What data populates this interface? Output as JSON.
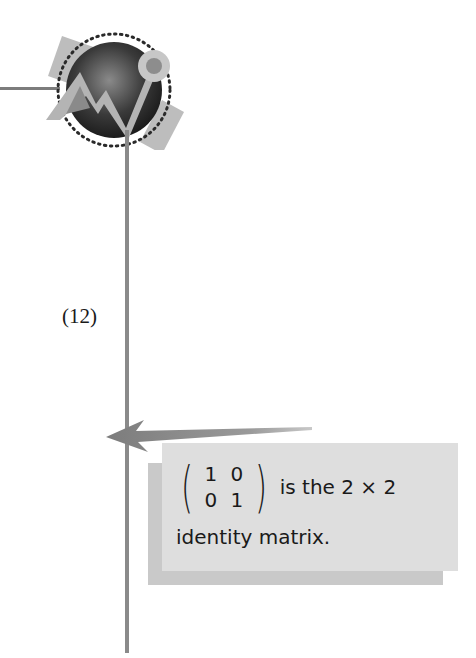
{
  "page": {
    "equation_number": "(12)",
    "callout": {
      "matrix": [
        [
          "1",
          "0"
        ],
        [
          "0",
          "1"
        ]
      ],
      "text_line1": "is the 2 × 2",
      "text_line2": "identity matrix."
    },
    "icon": "graphing-logo-icon"
  },
  "colors": {
    "rule": "#8a8a8a",
    "callout_bg": "#dedede",
    "callout_shadow": "#c9c9c9",
    "arrow": "#8f8f8f",
    "text": "#1a1a1a"
  }
}
